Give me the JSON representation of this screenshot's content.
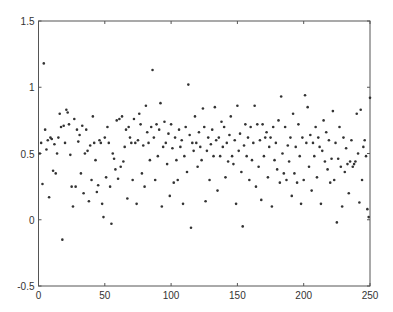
{
  "chart_data": {
    "type": "scatter",
    "title": "",
    "xlabel": "",
    "ylabel": "",
    "xlim": [
      0,
      250
    ],
    "ylim": [
      -0.5,
      1.5
    ],
    "xticks": [
      0,
      50,
      100,
      150,
      200,
      250
    ],
    "yticks": [
      -0.5,
      0,
      0.5,
      1,
      1.5
    ],
    "xtick_labels": [
      "0",
      "50",
      "100",
      "150",
      "200",
      "250"
    ],
    "ytick_labels": [
      "-0.5",
      "0",
      "0.5",
      "1",
      "1.5"
    ],
    "grid": false,
    "legend": null,
    "marker_color": "#333333",
    "series": [
      {
        "name": "samples",
        "points": [
          [
            1,
            0.5
          ],
          [
            2,
            0.58
          ],
          [
            3,
            0.27
          ],
          [
            4,
            1.18
          ],
          [
            5,
            0.68
          ],
          [
            6,
            0.53
          ],
          [
            7,
            0.6
          ],
          [
            8,
            0.17
          ],
          [
            9,
            0.62
          ],
          [
            10,
            0.61
          ],
          [
            11,
            0.37
          ],
          [
            12,
            0.57
          ],
          [
            13,
            0.35
          ],
          [
            14,
            0.5
          ],
          [
            15,
            0.62
          ],
          [
            16,
            0.8
          ],
          [
            17,
            0.7
          ],
          [
            18,
            -0.15
          ],
          [
            19,
            0.71
          ],
          [
            20,
            0.58
          ],
          [
            21,
            0.83
          ],
          [
            22,
            0.81
          ],
          [
            23,
            0.72
          ],
          [
            24,
            0.49
          ],
          [
            25,
            0.25
          ],
          [
            26,
            0.1
          ],
          [
            27,
            0.76
          ],
          [
            28,
            0.25
          ],
          [
            29,
            0.68
          ],
          [
            30,
            0.59
          ],
          [
            31,
            0.64
          ],
          [
            32,
            0.35
          ],
          [
            33,
            0.71
          ],
          [
            34,
            0.2
          ],
          [
            35,
            0.5
          ],
          [
            36,
            0.68
          ],
          [
            37,
            0.52
          ],
          [
            38,
            0.14
          ],
          [
            39,
            0.56
          ],
          [
            40,
            0.3
          ],
          [
            41,
            0.78
          ],
          [
            42,
            0.58
          ],
          [
            43,
            0.45
          ],
          [
            44,
            0.21
          ],
          [
            45,
            0.26
          ],
          [
            46,
            0.6
          ],
          [
            47,
            0.58
          ],
          [
            48,
            0.12
          ],
          [
            49,
            0.02
          ],
          [
            50,
            0.62
          ],
          [
            51,
            0.32
          ],
          [
            52,
            0.7
          ],
          [
            53,
            0.58
          ],
          [
            54,
            0.25
          ],
          [
            55,
            -0.03
          ],
          [
            56,
            0.5
          ],
          [
            57,
            0.46
          ],
          [
            58,
            0.38
          ],
          [
            59,
            0.75
          ],
          [
            60,
            0.31
          ],
          [
            61,
            0.76
          ],
          [
            62,
            0.4
          ],
          [
            63,
            0.78
          ],
          [
            64,
            0.44
          ],
          [
            65,
            0.55
          ],
          [
            66,
            0.68
          ],
          [
            67,
            0.16
          ],
          [
            68,
            0.7
          ],
          [
            69,
            0.62
          ],
          [
            70,
            0.58
          ],
          [
            71,
            0.3
          ],
          [
            72,
            0.76
          ],
          [
            73,
            0.58
          ],
          [
            74,
            0.12
          ],
          [
            75,
            0.6
          ],
          [
            76,
            0.8
          ],
          [
            77,
            0.72
          ],
          [
            78,
            0.35
          ],
          [
            79,
            0.56
          ],
          [
            80,
            0.25
          ],
          [
            81,
            0.86
          ],
          [
            82,
            0.66
          ],
          [
            83,
            0.58
          ],
          [
            84,
            0.45
          ],
          [
            85,
            0.7
          ],
          [
            86,
            1.13
          ],
          [
            87,
            0.62
          ],
          [
            88,
            0.3
          ],
          [
            89,
            0.72
          ],
          [
            90,
            0.48
          ],
          [
            91,
            0.68
          ],
          [
            92,
            0.88
          ],
          [
            93,
            0.1
          ],
          [
            94,
            0.55
          ],
          [
            95,
            0.74
          ],
          [
            96,
            0.58
          ],
          [
            97,
            0.42
          ],
          [
            98,
            0.65
          ],
          [
            99,
            0.18
          ],
          [
            100,
            0.72
          ],
          [
            101,
            0.54
          ],
          [
            102,
            0.28
          ],
          [
            103,
            0.62
          ],
          [
            104,
            0.45
          ],
          [
            105,
            0.3
          ],
          [
            106,
            0.68
          ],
          [
            107,
            0.55
          ],
          [
            108,
            0.6
          ],
          [
            109,
            0.12
          ],
          [
            110,
            0.48
          ],
          [
            111,
            0.7
          ],
          [
            112,
            0.36
          ],
          [
            113,
            1.02
          ],
          [
            114,
            0.64
          ],
          [
            115,
            -0.06
          ],
          [
            116,
            0.58
          ],
          [
            117,
            0.52
          ],
          [
            118,
            0.78
          ],
          [
            119,
            0.58
          ],
          [
            120,
            0.4
          ],
          [
            121,
            0.66
          ],
          [
            122,
            0.55
          ],
          [
            123,
            0.45
          ],
          [
            124,
            0.84
          ],
          [
            125,
            0.7
          ],
          [
            126,
            0.14
          ],
          [
            127,
            0.52
          ],
          [
            128,
            0.62
          ],
          [
            129,
            0.3
          ],
          [
            130,
            0.57
          ],
          [
            131,
            0.68
          ],
          [
            132,
            0.48
          ],
          [
            133,
            0.85
          ],
          [
            134,
            0.6
          ],
          [
            135,
            0.22
          ],
          [
            136,
            0.62
          ],
          [
            137,
            0.48
          ],
          [
            138,
            0.74
          ],
          [
            139,
            0.55
          ],
          [
            140,
            0.7
          ],
          [
            141,
            0.32
          ],
          [
            142,
            0.58
          ],
          [
            143,
            0.44
          ],
          [
            144,
            0.64
          ],
          [
            145,
            0.78
          ],
          [
            146,
            0.48
          ],
          [
            147,
            0.42
          ],
          [
            148,
            0.6
          ],
          [
            149,
            0.12
          ],
          [
            150,
            0.86
          ],
          [
            151,
            0.52
          ],
          [
            152,
            0.65
          ],
          [
            153,
            0.36
          ],
          [
            154,
            -0.05
          ],
          [
            155,
            0.56
          ],
          [
            156,
            0.72
          ],
          [
            157,
            0.48
          ],
          [
            158,
            0.62
          ],
          [
            159,
            0.3
          ],
          [
            160,
            0.7
          ],
          [
            161,
            0.45
          ],
          [
            162,
            0.58
          ],
          [
            163,
            0.86
          ],
          [
            164,
            0.25
          ],
          [
            165,
            0.72
          ],
          [
            166,
            0.4
          ],
          [
            167,
            0.6
          ],
          [
            168,
            0.15
          ],
          [
            169,
            0.72
          ],
          [
            170,
            0.48
          ],
          [
            171,
            0.62
          ],
          [
            172,
            0.66
          ],
          [
            173,
            0.32
          ],
          [
            174,
            0.55
          ],
          [
            175,
            0.62
          ],
          [
            176,
            0.1
          ],
          [
            177,
            0.7
          ],
          [
            178,
            0.45
          ],
          [
            179,
            0.58
          ],
          [
            180,
            0.38
          ],
          [
            181,
            0.75
          ],
          [
            182,
            0.28
          ],
          [
            183,
            0.93
          ],
          [
            184,
            0.5
          ],
          [
            185,
            0.35
          ],
          [
            186,
            0.7
          ],
          [
            187,
            0.3
          ],
          [
            188,
            0.56
          ],
          [
            189,
            0.44
          ],
          [
            190,
            0.62
          ],
          [
            191,
            0.18
          ],
          [
            192,
            0.8
          ],
          [
            193,
            0.35
          ],
          [
            194,
            0.55
          ],
          [
            195,
            0.28
          ],
          [
            196,
            0.72
          ],
          [
            197,
            0.48
          ],
          [
            198,
            0.12
          ],
          [
            199,
            0.62
          ],
          [
            200,
            0.3
          ],
          [
            201,
            0.94
          ],
          [
            202,
            0.58
          ],
          [
            203,
            0.85
          ],
          [
            204,
            0.4
          ],
          [
            205,
            0.64
          ],
          [
            206,
            0.22
          ],
          [
            207,
            0.58
          ],
          [
            208,
            0.48
          ],
          [
            209,
            0.7
          ],
          [
            210,
            0.32
          ],
          [
            211,
            0.62
          ],
          [
            212,
            0.55
          ],
          [
            213,
            0.12
          ],
          [
            214,
            0.52
          ],
          [
            215,
            0.75
          ],
          [
            216,
            0.44
          ],
          [
            217,
            0.66
          ],
          [
            218,
            0.38
          ],
          [
            219,
            0.6
          ],
          [
            220,
            0.28
          ],
          [
            221,
            0.46
          ],
          [
            222,
            0.82
          ],
          [
            223,
            0.3
          ],
          [
            224,
            0.58
          ],
          [
            225,
            -0.02
          ],
          [
            226,
            0.46
          ],
          [
            227,
            0.7
          ],
          [
            228,
            0.4
          ],
          [
            229,
            0.1
          ],
          [
            230,
            0.62
          ],
          [
            231,
            0.36
          ],
          [
            232,
            0.54
          ],
          [
            233,
            0.42
          ],
          [
            234,
            0.2
          ],
          [
            235,
            0.44
          ],
          [
            236,
            0.6
          ],
          [
            237,
            0.4
          ],
          [
            238,
            0.42
          ],
          [
            239,
            0.44
          ],
          [
            240,
            0.8
          ],
          [
            241,
            0.5
          ],
          [
            242,
            0.13
          ],
          [
            243,
            0.83
          ],
          [
            244,
            0.3
          ],
          [
            245,
            0.55
          ],
          [
            246,
            0.6
          ],
          [
            247,
            0.48
          ],
          [
            248,
            0.08
          ],
          [
            249,
            0.02
          ],
          [
            250,
            0.92
          ]
        ]
      }
    ]
  }
}
